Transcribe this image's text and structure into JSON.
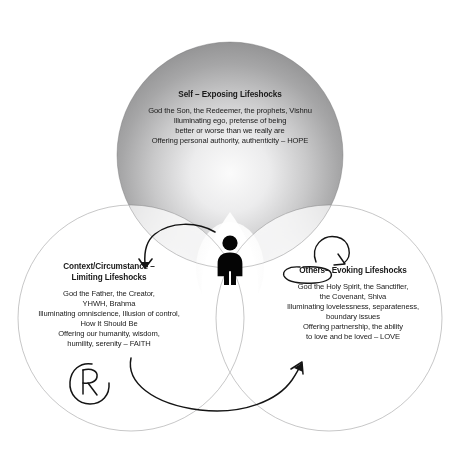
{
  "diagram": {
    "background_color": "#ffffff",
    "circle_fill_outer": "#8c8c8c",
    "circle_fill_inner": "#f2f2f2",
    "ink_color": "#1a1a1a",
    "center_figure": {
      "icon": "person-silhouette-icon",
      "color": "#000000"
    },
    "circles": [
      {
        "id": "self",
        "position": "top",
        "title": "Self – Exposing Lifeshocks",
        "body": "God the Son, the Redeemer, the prophets, Vishnu\nIlluminating ego, pretense of being\nbetter or worse than we really are\nOffering personal authority, authenticity – HOPE",
        "keyword": "HOPE"
      },
      {
        "id": "context",
        "position": "bottom-left",
        "title": "Context/Circumstance –\nLimiting Lifeshocks",
        "body": "God the Father, the Creator,\nYHWH, Brahma\nIlluminating omniscience, Illusion of control,\nHow It Should Be\nOffering our humanity, wisdom,\nhumility, serenity – FAITH",
        "keyword": "FAITH"
      },
      {
        "id": "others",
        "position": "bottom-right",
        "title": "Others– Evoking Lifeshocks",
        "body": "God the Holy Spirit, the Sanctifier,\nthe Covenant, Shiva\nIlluminating lovelessness, separateness,\nboundary issues\nOffering partnership, the ability\nto love and be loved – LOVE",
        "keyword": "LOVE"
      }
    ],
    "annotations": [
      {
        "id": "arrow-to-context",
        "type": "curved-arrow",
        "description": "Hand-drawn arrow curving from center down-left toward Context/Circumstance"
      },
      {
        "id": "loop-above-others",
        "type": "loop-arrow",
        "description": "Small hand-drawn looping arrow above the Others label"
      },
      {
        "id": "oval-around-others",
        "type": "ellipse-circle",
        "description": "Hand-drawn oval circling the word Others"
      },
      {
        "id": "bottom-sweep-arrow",
        "type": "curved-arrow",
        "description": "Long hand-drawn arrow sweeping along the bottom from left circle to right circle"
      },
      {
        "id": "handwritten-r",
        "type": "handwriting",
        "text": "R",
        "description": "Handwritten letter R with a circle mark in the lower-left circle"
      }
    ]
  }
}
